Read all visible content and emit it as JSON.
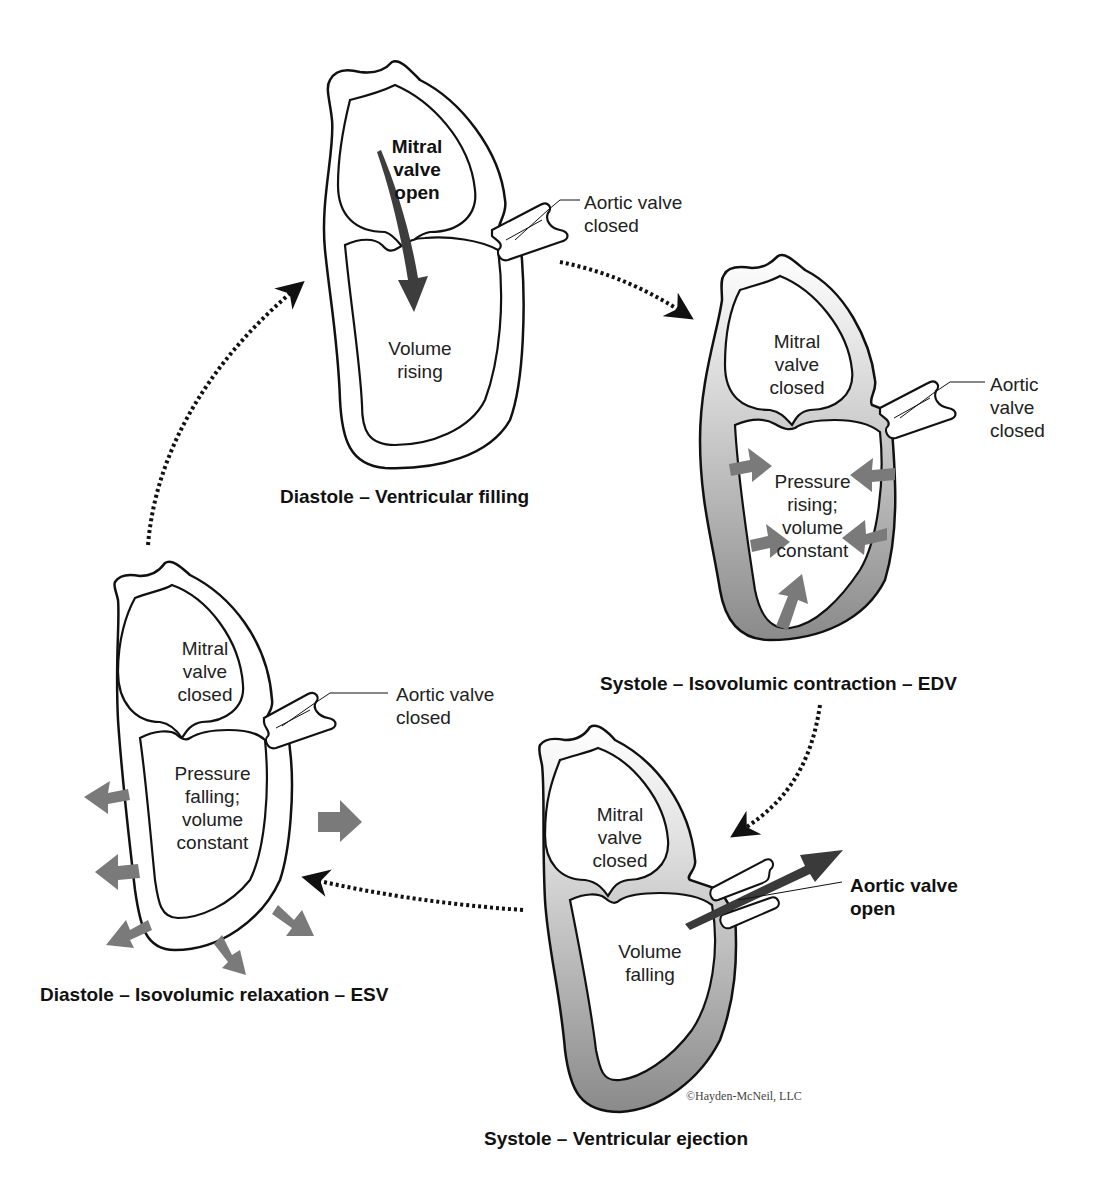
{
  "colors": {
    "outline": "#111111",
    "muscle_shade": "#8c8c8c",
    "arrow_gray": "#777777",
    "arrow_dark": "#3a3a3a",
    "background": "#ffffff"
  },
  "cycle_arrows": {
    "style": "dotted",
    "direction": "clockwise",
    "icon": "dotted-curved-arrow"
  },
  "panels": [
    {
      "id": "diastole-filling",
      "caption": "Diastole – Ventricular filling",
      "mitral_label": [
        "Mitral",
        "valve",
        "open"
      ],
      "mitral_bold": true,
      "aortic_label": [
        "Aortic valve",
        "closed"
      ],
      "aortic_bold": false,
      "ventricle_label": [
        "Volume",
        "rising"
      ],
      "icons": [
        "blood-flow-arrow-icon"
      ]
    },
    {
      "id": "systole-isovolumic-contraction",
      "caption": "Systole – Isovolumic contraction – EDV",
      "mitral_label": [
        "Mitral",
        "valve",
        "closed"
      ],
      "aortic_label": [
        "Aortic",
        "valve",
        "closed"
      ],
      "ventricle_label": [
        "Pressure",
        "rising;",
        "volume",
        "constant"
      ],
      "icons": [
        "inward-pressure-arrow-icon"
      ]
    },
    {
      "id": "systole-ejection",
      "caption": "Systole – Ventricular ejection",
      "mitral_label": [
        "Mitral",
        "valve",
        "closed"
      ],
      "aortic_label": [
        "Aortic valve",
        "open"
      ],
      "aortic_bold": true,
      "ventricle_label": [
        "Volume",
        "falling"
      ],
      "icons": [
        "ejection-arrow-icon"
      ]
    },
    {
      "id": "diastole-isovolumic-relaxation",
      "caption": "Diastole – Isovolumic relaxation – ESV",
      "mitral_label": [
        "Mitral",
        "valve",
        "closed"
      ],
      "aortic_label": [
        "Aortic valve",
        "closed"
      ],
      "ventricle_label": [
        "Pressure",
        "falling;",
        "volume",
        "constant"
      ],
      "icons": [
        "outward-relaxation-arrow-icon"
      ]
    }
  ],
  "copyright": "©Hayden-McNeil, LLC"
}
